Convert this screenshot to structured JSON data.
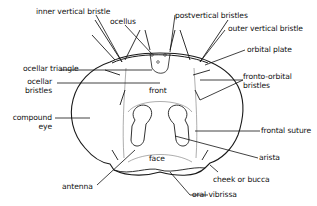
{
  "diagram": {
    "labels": {
      "inner_vertical_bristle": "inner vertical bristle",
      "ocellus": "ocellus",
      "postvertical_bristles": "postvertical bristles",
      "outer_vertical_bristle": "outer vertical bristle",
      "orbital_plate": "orbital plate",
      "ocellar_triangle": "ocellar triangle",
      "ocellar_bristles_1": "ocellar",
      "ocellar_bristles_2": "bristles",
      "fronto_orbital_bristles_1": "fronto-orbital",
      "fronto_orbital_bristles_2": "bristles",
      "front": "front",
      "compound_eye_1": "compound",
      "compound_eye_2": "eye",
      "frontal_suture": "frontal suture",
      "arista": "arista",
      "face": "face",
      "cheek_or_bucca": "cheek or bucca",
      "antenna": "antenna",
      "oral_vibrissa": "oral vibrissa"
    }
  }
}
